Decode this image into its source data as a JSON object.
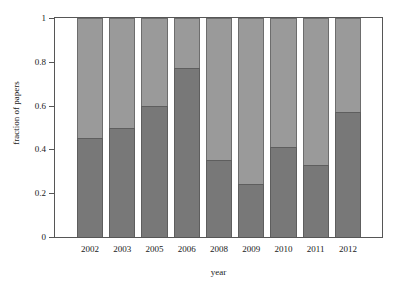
{
  "chart_data": {
    "type": "bar",
    "title": "",
    "xlabel": "year",
    "ylabel": "fraction of papers",
    "categories": [
      "2002",
      "2003",
      "2005",
      "2006",
      "2008",
      "2009",
      "2010",
      "2011",
      "2012"
    ],
    "ylim": [
      0,
      1
    ],
    "yticks": [
      "0",
      "0.2",
      "0.4",
      "0.6",
      "0.8",
      "1"
    ],
    "ytick_values": [
      0,
      0.2,
      0.4,
      0.6,
      0.8,
      1
    ],
    "grid": false,
    "legend": "none",
    "stacked": true,
    "series": [
      {
        "name": "lower-segment",
        "color": "#787878",
        "values": [
          0.45,
          0.5,
          0.6,
          0.77,
          0.35,
          0.24,
          0.41,
          0.33,
          0.57
        ]
      },
      {
        "name": "upper-segment",
        "color": "#9a9a9a",
        "values": [
          0.55,
          0.5,
          0.4,
          0.23,
          0.65,
          0.76,
          0.59,
          0.67,
          0.43
        ]
      }
    ]
  },
  "axes": {
    "y_title": "fraction of papers",
    "x_title": "year"
  }
}
